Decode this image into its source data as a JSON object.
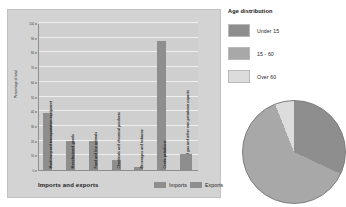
{
  "bar_panel": {
    "caption": "Imports and exports",
    "y_axis_label": "Percentage of total",
    "legend": [
      {
        "label": "Imports",
        "color": "#8e8e8e"
      },
      {
        "label": "Exports",
        "color": "#8e8e8e"
      }
    ]
  },
  "age_panel": {
    "title": "Age distribution",
    "legend": [
      {
        "label": "Under 15",
        "color": "#8e8e8e"
      },
      {
        "label": "15 - 60",
        "color": "#a8a8a8"
      },
      {
        "label": "Over 60",
        "color": "#dcdcdc"
      }
    ]
  },
  "chart_data": [
    {
      "type": "bar",
      "title": "Imports and exports",
      "xlabel": "",
      "ylabel": "Percentage of total",
      "ylim": [
        0,
        100
      ],
      "yticks": [
        0,
        10,
        20,
        30,
        40,
        50,
        60,
        70,
        80,
        90,
        100
      ],
      "grid": true,
      "legend": [
        "Imports",
        "Exports"
      ],
      "legend_position": "bottom-right",
      "categories": [
        "Machinery and transportation equipment",
        "Manufactured goods",
        "Food and live animals",
        "Chemicals and chemical products",
        "Beverages and tobacco",
        "Crude petroleum",
        "Liquefied gas and other non-petroleum exports"
      ],
      "values": [
        39,
        20,
        20,
        7,
        2,
        88,
        11
      ],
      "bar_color": "#8e8e8e"
    },
    {
      "type": "pie",
      "title": "Age distribution",
      "labels": [
        "Under 15",
        "15 - 60",
        "Over 60"
      ],
      "values": [
        32,
        62,
        6
      ],
      "colors": [
        "#8e8e8e",
        "#a8a8a8",
        "#dcdcdc"
      ],
      "legend_position": "top"
    }
  ]
}
